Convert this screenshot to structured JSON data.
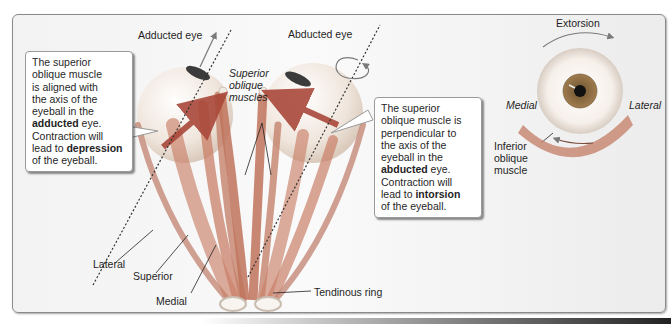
{
  "diagram": {
    "labels": {
      "adducted_eye": "Adducted eye",
      "abducted_eye": "Abducted eye",
      "superior_oblique_muscles_1": "Superior",
      "superior_oblique_muscles_2": "oblique",
      "superior_oblique_muscles_3": "muscles",
      "lateral": "Lateral",
      "superior": "Superior",
      "medial": "Medial",
      "rectus_muscles": "Rectus muscles",
      "tendinous_ring": "Tendinous ring",
      "extorsion": "Extorsion",
      "medial_right": "Medial",
      "lateral_right": "Lateral",
      "inferior_oblique_1": "Inferior",
      "inferior_oblique_2": "oblique",
      "inferior_oblique_3": "muscle"
    },
    "callout_left": {
      "line1": "The superior",
      "line2": "oblique muscle",
      "line3": "is aligned with",
      "line4": "the axis of the",
      "line5": "eyeball in the",
      "line6_bold": "adducted",
      "line6_rest": " eye.",
      "line7": "Contraction will",
      "line8_pre": "lead to ",
      "line8_bold": "depression",
      "line9": "of the eyeball."
    },
    "callout_right": {
      "line1": "The superior",
      "line2": "oblique muscle is",
      "line3": "perpendicular to",
      "line4": "the axis of the",
      "line5": "eyeball in the",
      "line6_bold": "abducted",
      "line6_rest": " eye.",
      "line7": "Contraction will",
      "line8_pre": "lead to ",
      "line8_bold": "intorsion",
      "line9": "of the eyeball."
    },
    "colors": {
      "muscle": "#c9785f",
      "eyeball": "#f3e7dc",
      "iris": "#8a6a3c",
      "arrow": "#a9483a",
      "border": "#8a8a8a"
    }
  }
}
